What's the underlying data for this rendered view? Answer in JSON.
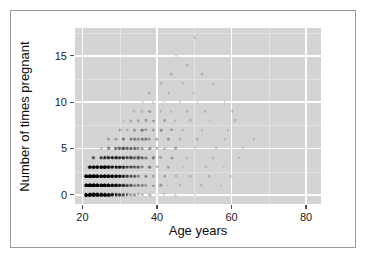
{
  "chart_data": {
    "type": "scatter",
    "title": "",
    "xlabel": "Age years",
    "ylabel": "Number of times pregnant",
    "xlim": [
      18,
      84
    ],
    "ylim": [
      -1,
      18
    ],
    "xticks": [
      20,
      40,
      60,
      80
    ],
    "yticks": [
      0,
      5,
      10,
      15
    ],
    "xtick_labels": [
      "20",
      "40",
      "60",
      "80"
    ],
    "ytick_labels": [
      "0",
      "5",
      "10",
      "15"
    ],
    "grid": true,
    "legend": "none",
    "panel_background": "#d4d4d4",
    "gridline_color": "#ffffff",
    "point_color": "#000000",
    "points": [
      {
        "x": 21,
        "y": 0,
        "n": 28
      },
      {
        "x": 22,
        "y": 0,
        "n": 26
      },
      {
        "x": 23,
        "y": 0,
        "n": 24
      },
      {
        "x": 24,
        "y": 0,
        "n": 21
      },
      {
        "x": 25,
        "y": 0,
        "n": 18
      },
      {
        "x": 26,
        "y": 0,
        "n": 14
      },
      {
        "x": 27,
        "y": 0,
        "n": 11
      },
      {
        "x": 28,
        "y": 0,
        "n": 9
      },
      {
        "x": 29,
        "y": 0,
        "n": 7
      },
      {
        "x": 30,
        "y": 0,
        "n": 6
      },
      {
        "x": 31,
        "y": 0,
        "n": 5
      },
      {
        "x": 32,
        "y": 0,
        "n": 4
      },
      {
        "x": 33,
        "y": 0,
        "n": 3
      },
      {
        "x": 34,
        "y": 0,
        "n": 3
      },
      {
        "x": 35,
        "y": 0,
        "n": 2
      },
      {
        "x": 36,
        "y": 0,
        "n": 2
      },
      {
        "x": 38,
        "y": 0,
        "n": 2
      },
      {
        "x": 40,
        "y": 0,
        "n": 1
      },
      {
        "x": 42,
        "y": 0,
        "n": 1
      },
      {
        "x": 45,
        "y": 0,
        "n": 1
      },
      {
        "x": 50,
        "y": 0,
        "n": 1
      },
      {
        "x": 21,
        "y": 1,
        "n": 30
      },
      {
        "x": 22,
        "y": 1,
        "n": 29
      },
      {
        "x": 23,
        "y": 1,
        "n": 26
      },
      {
        "x": 24,
        "y": 1,
        "n": 23
      },
      {
        "x": 25,
        "y": 1,
        "n": 20
      },
      {
        "x": 26,
        "y": 1,
        "n": 16
      },
      {
        "x": 27,
        "y": 1,
        "n": 13
      },
      {
        "x": 28,
        "y": 1,
        "n": 11
      },
      {
        "x": 29,
        "y": 1,
        "n": 9
      },
      {
        "x": 30,
        "y": 1,
        "n": 7
      },
      {
        "x": 31,
        "y": 1,
        "n": 6
      },
      {
        "x": 32,
        "y": 1,
        "n": 5
      },
      {
        "x": 33,
        "y": 1,
        "n": 4
      },
      {
        "x": 34,
        "y": 1,
        "n": 3
      },
      {
        "x": 35,
        "y": 1,
        "n": 3
      },
      {
        "x": 36,
        "y": 1,
        "n": 3
      },
      {
        "x": 37,
        "y": 1,
        "n": 2
      },
      {
        "x": 39,
        "y": 1,
        "n": 2
      },
      {
        "x": 41,
        "y": 1,
        "n": 2
      },
      {
        "x": 43,
        "y": 1,
        "n": 1
      },
      {
        "x": 46,
        "y": 1,
        "n": 1
      },
      {
        "x": 52,
        "y": 1,
        "n": 1
      },
      {
        "x": 57,
        "y": 1,
        "n": 1
      },
      {
        "x": 21,
        "y": 2,
        "n": 18
      },
      {
        "x": 22,
        "y": 2,
        "n": 20
      },
      {
        "x": 23,
        "y": 2,
        "n": 19
      },
      {
        "x": 24,
        "y": 2,
        "n": 17
      },
      {
        "x": 25,
        "y": 2,
        "n": 15
      },
      {
        "x": 26,
        "y": 2,
        "n": 13
      },
      {
        "x": 27,
        "y": 2,
        "n": 11
      },
      {
        "x": 28,
        "y": 2,
        "n": 10
      },
      {
        "x": 29,
        "y": 2,
        "n": 8
      },
      {
        "x": 30,
        "y": 2,
        "n": 7
      },
      {
        "x": 31,
        "y": 2,
        "n": 6
      },
      {
        "x": 32,
        "y": 2,
        "n": 5
      },
      {
        "x": 33,
        "y": 2,
        "n": 4
      },
      {
        "x": 34,
        "y": 2,
        "n": 4
      },
      {
        "x": 35,
        "y": 2,
        "n": 3
      },
      {
        "x": 37,
        "y": 2,
        "n": 3
      },
      {
        "x": 39,
        "y": 2,
        "n": 2
      },
      {
        "x": 42,
        "y": 2,
        "n": 2
      },
      {
        "x": 45,
        "y": 2,
        "n": 1
      },
      {
        "x": 49,
        "y": 2,
        "n": 1
      },
      {
        "x": 54,
        "y": 2,
        "n": 1
      },
      {
        "x": 60,
        "y": 2,
        "n": 1
      },
      {
        "x": 22,
        "y": 3,
        "n": 8
      },
      {
        "x": 23,
        "y": 3,
        "n": 9
      },
      {
        "x": 24,
        "y": 3,
        "n": 10
      },
      {
        "x": 25,
        "y": 3,
        "n": 11
      },
      {
        "x": 26,
        "y": 3,
        "n": 10
      },
      {
        "x": 27,
        "y": 3,
        "n": 9
      },
      {
        "x": 28,
        "y": 3,
        "n": 8
      },
      {
        "x": 29,
        "y": 3,
        "n": 7
      },
      {
        "x": 30,
        "y": 3,
        "n": 7
      },
      {
        "x": 31,
        "y": 3,
        "n": 6
      },
      {
        "x": 32,
        "y": 3,
        "n": 5
      },
      {
        "x": 33,
        "y": 3,
        "n": 5
      },
      {
        "x": 34,
        "y": 3,
        "n": 4
      },
      {
        "x": 35,
        "y": 3,
        "n": 4
      },
      {
        "x": 36,
        "y": 3,
        "n": 3
      },
      {
        "x": 38,
        "y": 3,
        "n": 3
      },
      {
        "x": 40,
        "y": 3,
        "n": 2
      },
      {
        "x": 43,
        "y": 3,
        "n": 2
      },
      {
        "x": 47,
        "y": 3,
        "n": 1
      },
      {
        "x": 53,
        "y": 3,
        "n": 1
      },
      {
        "x": 58,
        "y": 3,
        "n": 1
      },
      {
        "x": 23,
        "y": 4,
        "n": 4
      },
      {
        "x": 25,
        "y": 4,
        "n": 5
      },
      {
        "x": 26,
        "y": 4,
        "n": 6
      },
      {
        "x": 27,
        "y": 4,
        "n": 6
      },
      {
        "x": 28,
        "y": 4,
        "n": 7
      },
      {
        "x": 29,
        "y": 4,
        "n": 7
      },
      {
        "x": 30,
        "y": 4,
        "n": 6
      },
      {
        "x": 31,
        "y": 4,
        "n": 6
      },
      {
        "x": 32,
        "y": 4,
        "n": 5
      },
      {
        "x": 33,
        "y": 4,
        "n": 5
      },
      {
        "x": 34,
        "y": 4,
        "n": 4
      },
      {
        "x": 35,
        "y": 4,
        "n": 4
      },
      {
        "x": 36,
        "y": 4,
        "n": 4
      },
      {
        "x": 37,
        "y": 4,
        "n": 3
      },
      {
        "x": 39,
        "y": 4,
        "n": 3
      },
      {
        "x": 41,
        "y": 4,
        "n": 2
      },
      {
        "x": 44,
        "y": 4,
        "n": 2
      },
      {
        "x": 48,
        "y": 4,
        "n": 1
      },
      {
        "x": 55,
        "y": 4,
        "n": 1
      },
      {
        "x": 62,
        "y": 4,
        "n": 1
      },
      {
        "x": 25,
        "y": 5,
        "n": 2
      },
      {
        "x": 27,
        "y": 5,
        "n": 3
      },
      {
        "x": 29,
        "y": 5,
        "n": 4
      },
      {
        "x": 30,
        "y": 5,
        "n": 4
      },
      {
        "x": 31,
        "y": 5,
        "n": 5
      },
      {
        "x": 32,
        "y": 5,
        "n": 4
      },
      {
        "x": 33,
        "y": 5,
        "n": 4
      },
      {
        "x": 34,
        "y": 5,
        "n": 4
      },
      {
        "x": 35,
        "y": 5,
        "n": 3
      },
      {
        "x": 36,
        "y": 5,
        "n": 3
      },
      {
        "x": 38,
        "y": 5,
        "n": 3
      },
      {
        "x": 40,
        "y": 5,
        "n": 2
      },
      {
        "x": 42,
        "y": 5,
        "n": 2
      },
      {
        "x": 45,
        "y": 5,
        "n": 2
      },
      {
        "x": 50,
        "y": 5,
        "n": 1
      },
      {
        "x": 56,
        "y": 5,
        "n": 1
      },
      {
        "x": 63,
        "y": 5,
        "n": 1
      },
      {
        "x": 27,
        "y": 6,
        "n": 2
      },
      {
        "x": 29,
        "y": 6,
        "n": 2
      },
      {
        "x": 31,
        "y": 6,
        "n": 3
      },
      {
        "x": 33,
        "y": 6,
        "n": 3
      },
      {
        "x": 34,
        "y": 6,
        "n": 3
      },
      {
        "x": 35,
        "y": 6,
        "n": 3
      },
      {
        "x": 36,
        "y": 6,
        "n": 3
      },
      {
        "x": 37,
        "y": 6,
        "n": 3
      },
      {
        "x": 38,
        "y": 6,
        "n": 2
      },
      {
        "x": 40,
        "y": 6,
        "n": 2
      },
      {
        "x": 43,
        "y": 6,
        "n": 2
      },
      {
        "x": 46,
        "y": 6,
        "n": 1
      },
      {
        "x": 51,
        "y": 6,
        "n": 1
      },
      {
        "x": 58,
        "y": 6,
        "n": 1
      },
      {
        "x": 66,
        "y": 6,
        "n": 1
      },
      {
        "x": 30,
        "y": 7,
        "n": 2
      },
      {
        "x": 32,
        "y": 7,
        "n": 2
      },
      {
        "x": 34,
        "y": 7,
        "n": 2
      },
      {
        "x": 36,
        "y": 7,
        "n": 3
      },
      {
        "x": 37,
        "y": 7,
        "n": 2
      },
      {
        "x": 39,
        "y": 7,
        "n": 2
      },
      {
        "x": 41,
        "y": 7,
        "n": 2
      },
      {
        "x": 44,
        "y": 7,
        "n": 2
      },
      {
        "x": 47,
        "y": 7,
        "n": 1
      },
      {
        "x": 52,
        "y": 7,
        "n": 1
      },
      {
        "x": 59,
        "y": 7,
        "n": 1
      },
      {
        "x": 31,
        "y": 8,
        "n": 1
      },
      {
        "x": 33,
        "y": 8,
        "n": 2
      },
      {
        "x": 35,
        "y": 8,
        "n": 2
      },
      {
        "x": 37,
        "y": 8,
        "n": 2
      },
      {
        "x": 39,
        "y": 8,
        "n": 2
      },
      {
        "x": 42,
        "y": 8,
        "n": 2
      },
      {
        "x": 45,
        "y": 8,
        "n": 1
      },
      {
        "x": 49,
        "y": 8,
        "n": 1
      },
      {
        "x": 54,
        "y": 8,
        "n": 1
      },
      {
        "x": 61,
        "y": 8,
        "n": 1
      },
      {
        "x": 34,
        "y": 9,
        "n": 1
      },
      {
        "x": 36,
        "y": 9,
        "n": 1
      },
      {
        "x": 38,
        "y": 9,
        "n": 2
      },
      {
        "x": 41,
        "y": 9,
        "n": 1
      },
      {
        "x": 44,
        "y": 9,
        "n": 1
      },
      {
        "x": 48,
        "y": 9,
        "n": 1
      },
      {
        "x": 53,
        "y": 9,
        "n": 1
      },
      {
        "x": 60,
        "y": 9,
        "n": 1
      },
      {
        "x": 36,
        "y": 10,
        "n": 1
      },
      {
        "x": 39,
        "y": 10,
        "n": 1
      },
      {
        "x": 42,
        "y": 10,
        "n": 1
      },
      {
        "x": 46,
        "y": 10,
        "n": 1
      },
      {
        "x": 51,
        "y": 10,
        "n": 1
      },
      {
        "x": 58,
        "y": 10,
        "n": 1
      },
      {
        "x": 38,
        "y": 11,
        "n": 1
      },
      {
        "x": 43,
        "y": 11,
        "n": 1
      },
      {
        "x": 50,
        "y": 11,
        "n": 1
      },
      {
        "x": 41,
        "y": 12,
        "n": 1
      },
      {
        "x": 47,
        "y": 12,
        "n": 1
      },
      {
        "x": 55,
        "y": 12,
        "n": 1
      },
      {
        "x": 44,
        "y": 13,
        "n": 1
      },
      {
        "x": 52,
        "y": 13,
        "n": 1
      },
      {
        "x": 48,
        "y": 14,
        "n": 1
      },
      {
        "x": 45,
        "y": 15,
        "n": 1
      },
      {
        "x": 50,
        "y": 17,
        "n": 1
      }
    ]
  }
}
